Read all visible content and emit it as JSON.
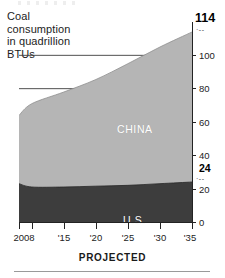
{
  "chart_data": {
    "type": "area",
    "stacked": true,
    "title": "Coal consumption in quadrillion BTUs",
    "xlabel": "PROJECTED",
    "ylabel": "",
    "grid": true,
    "grid_axis": "y",
    "legend_position": "inline-on-series",
    "xlim": [
      2008,
      2035
    ],
    "ylim": [
      0,
      120
    ],
    "x": [
      2008,
      2010,
      2015,
      2020,
      2025,
      2030,
      2035
    ],
    "x_tick_values": [
      2008,
      2010,
      2015,
      2020,
      2025,
      2030,
      2035
    ],
    "x_tick_labels": [
      "2008",
      "",
      "'15",
      "'20",
      "'25",
      "'30",
      "'35"
    ],
    "y_ticks": [
      0,
      20,
      40,
      60,
      80,
      100
    ],
    "y_tick_labels": [
      "0",
      "20",
      "40",
      "60",
      "80",
      "100"
    ],
    "series": [
      {
        "name": "U.S.",
        "label": "U.S.",
        "color": "#3d3d3d",
        "label_color": "#ffffff",
        "values": [
          23,
          21,
          21,
          21.5,
          22,
          23,
          24
        ]
      },
      {
        "name": "CHINA",
        "label": "CHINA",
        "color": "#b5b5b5",
        "label_color": "#ffffff",
        "values": [
          41,
          50,
          57,
          64,
          73,
          82,
          90
        ]
      }
    ],
    "totals": [
      64,
      71,
      78,
      85.5,
      95,
      105,
      114
    ],
    "annotations": [
      {
        "name": "total-2035",
        "text": "114",
        "value": 114,
        "bold": true,
        "leader": "dotted"
      },
      {
        "name": "us-2035",
        "text": "24",
        "value": 24,
        "bold": true,
        "leader": "dotted"
      }
    ]
  },
  "title": {
    "line1": "Coal",
    "line2": "consumption",
    "line3": "in quadrillion",
    "line4": "BTUs"
  },
  "axis": {
    "y_labels": {
      "t100": "100",
      "t80": "80",
      "t60": "60",
      "t40": "40",
      "t24": "24",
      "t20": "20",
      "t0": "0"
    },
    "x_labels": {
      "x2008": "2008",
      "x2015": "'15",
      "x2020": "'20",
      "x2025": "'25",
      "x2030": "'30",
      "x2035": "'35"
    },
    "callout_total": "114",
    "leader_dots": "·--"
  },
  "series_labels": {
    "china": "CHINA",
    "us": "U.S."
  },
  "footer": {
    "projected": "PROJECTED"
  }
}
